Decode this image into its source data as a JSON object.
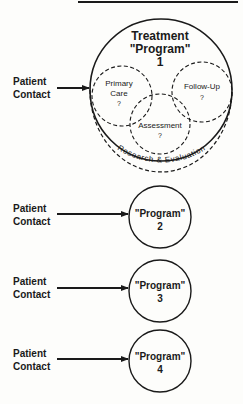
{
  "diagram": {
    "top_rule": true,
    "main_program": {
      "title_line1": "Treatment",
      "title_line2": "\"Program\"",
      "number": "1",
      "components": [
        {
          "label_line1": "Primary",
          "label_line2": "Care",
          "mark": "?"
        },
        {
          "label_line1": "Follow-Up",
          "label_line2": "",
          "mark": "?"
        },
        {
          "label_line1": "Assessment",
          "label_line2": "",
          "mark": "?"
        }
      ],
      "outer_band": {
        "words": [
          "Research",
          "&",
          "Evaluation"
        ]
      }
    },
    "inputs": [
      {
        "line1": "Patient",
        "line2": "Contact"
      },
      {
        "line1": "Patient",
        "line2": "Contact"
      },
      {
        "line1": "Patient",
        "line2": "Contact"
      },
      {
        "line1": "Patient",
        "line2": "Contact"
      }
    ],
    "programs": [
      {
        "label": "\"Program\"",
        "number": "2"
      },
      {
        "label": "\"Program\"",
        "number": "3"
      },
      {
        "label": "\"Program\"",
        "number": "4"
      }
    ]
  }
}
